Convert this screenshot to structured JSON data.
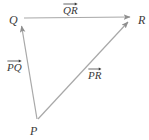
{
  "figure": {
    "type": "vector-triangle-diagram",
    "width": 149,
    "height": 140,
    "background_color": "#ffffff",
    "line_color": "#a8a8a8",
    "text_color": "#3a3a3a"
  },
  "vertices": [
    {
      "id": "q",
      "label": "Q",
      "x": 21,
      "y": 18
    },
    {
      "id": "r",
      "label": "R",
      "x": 133,
      "y": 17
    },
    {
      "id": "p",
      "label": "P",
      "x": 37,
      "y": 120
    }
  ],
  "vectors": [
    {
      "id": "qr",
      "label": "QR",
      "notation": "vector-overarrow",
      "from": "Q",
      "to": "R",
      "from_x": 24,
      "from_y": 18,
      "to_x": 132,
      "to_y": 17
    },
    {
      "id": "pq",
      "label": "PQ",
      "notation": "vector-overarrow",
      "from": "P",
      "to": "Q",
      "from_x": 37,
      "from_y": 119,
      "to_x": 21,
      "to_y": 22
    },
    {
      "id": "pr",
      "label": "PR",
      "notation": "vector-overarrow",
      "from": "P",
      "to": "R",
      "from_x": 38,
      "from_y": 119,
      "to_x": 131,
      "to_y": 19
    }
  ]
}
